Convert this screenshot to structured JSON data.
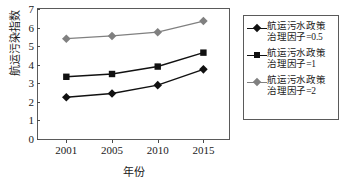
{
  "chart_data": {
    "type": "line",
    "title": "",
    "xlabel": "年份",
    "ylabel": "航运污染指数",
    "categories": [
      "2001",
      "2005",
      "2010",
      "2015"
    ],
    "ylim": [
      0,
      7
    ],
    "yticks": [
      "0",
      "1",
      "2",
      "3",
      "4",
      "5",
      "6",
      "7"
    ],
    "grid": false,
    "legend_position": "right",
    "series": [
      {
        "name": "航运污水政策治理因子=0.5",
        "values": [
          2.25,
          2.45,
          2.9,
          3.75
        ],
        "color": "#111111",
        "marker": "diamond"
      },
      {
        "name": "航运污水政策治理因子=1",
        "values": [
          3.35,
          3.5,
          3.9,
          4.65
        ],
        "color": "#111111",
        "marker": "square"
      },
      {
        "name": "航运污水政策治理因子=2",
        "values": [
          5.4,
          5.55,
          5.75,
          6.35
        ],
        "color": "#808080",
        "marker": "diamond"
      }
    ]
  }
}
